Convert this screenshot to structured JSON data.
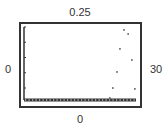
{
  "window": {
    "ymax_label": "0.25",
    "ymin_label": "0",
    "xmin_label": "0",
    "xmax_label": "30"
  },
  "colors": {
    "frame": "#333333",
    "axis": "#333333",
    "points": "#555555",
    "background": "#ffffff"
  },
  "chart_data": {
    "type": "scatter",
    "title": "",
    "xlabel": "",
    "ylabel": "",
    "xlim": [
      0,
      30
    ],
    "ylim": [
      0,
      0.25
    ],
    "grid": false,
    "legend": null,
    "y_ticks_count": 5,
    "x_axis_style": "dotted-thick",
    "series": [
      {
        "name": "points",
        "x": [
          23.0,
          23.8,
          24.9,
          25.7,
          26.8,
          27.9,
          28.9,
          29.7
        ],
        "y": [
          0.007,
          0.041,
          0.096,
          0.175,
          0.24,
          0.226,
          0.137,
          0.038
        ]
      }
    ],
    "annotations": [
      {
        "text": "0.25",
        "position": "top",
        "meaning": "Ymax"
      },
      {
        "text": "0",
        "position": "left",
        "meaning": "Xmin"
      },
      {
        "text": "30",
        "position": "right",
        "meaning": "Xmax"
      },
      {
        "text": "0",
        "position": "bottom",
        "meaning": "Ymin"
      }
    ]
  }
}
